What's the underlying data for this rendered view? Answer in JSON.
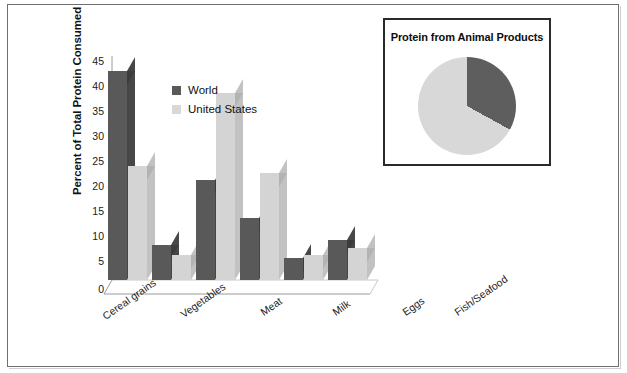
{
  "chart_data": {
    "type": "bar",
    "title": "",
    "xlabel": "",
    "ylabel": "Percent of Total Protein Consumed",
    "ylim": [
      0,
      45
    ],
    "ytick_step": 5,
    "yticks": [
      45,
      40,
      35,
      30,
      25,
      20,
      15,
      10,
      5,
      0
    ],
    "grid": false,
    "legend_position": "inside-upper-left",
    "categories": [
      "Cereal grains",
      "Vegetables",
      "Meat",
      "Milk",
      "Eggs",
      "Fish/Seafood"
    ],
    "series": [
      {
        "name": "World",
        "color": "#595959",
        "values": [
          42,
          7,
          20,
          12.5,
          4.5,
          8
        ]
      },
      {
        "name": "United States",
        "color": "#d4d4d4",
        "values": [
          23,
          5,
          37.5,
          21.5,
          5,
          6.5
        ]
      }
    ],
    "inset": {
      "type": "pie",
      "title": "Protein from Animal Products",
      "slices": [
        {
          "name": "Animal",
          "value": 33,
          "color": "#5e5e5e"
        },
        {
          "name": "Other",
          "value": 67,
          "color": "#d8d8d8"
        }
      ],
      "start_angle_deg": 0
    }
  },
  "axis": {
    "y_title": "Percent of Total Protein Consumed",
    "y_tick_0": "0",
    "y_tick_5": "5",
    "y_tick_10": "10",
    "y_tick_15": "15",
    "y_tick_20": "20",
    "y_tick_25": "25",
    "y_tick_30": "30",
    "y_tick_35": "35",
    "y_tick_40": "40",
    "y_tick_45": "45"
  },
  "legend": {
    "items": [
      {
        "label": "World"
      },
      {
        "label": "United States"
      }
    ]
  },
  "xaxis": {
    "labels": [
      {
        "text": "Cereal grains"
      },
      {
        "text": "Vegetables"
      },
      {
        "text": "Meat"
      },
      {
        "text": "Milk"
      },
      {
        "text": "Eggs"
      },
      {
        "text": "Fish/Seafood"
      }
    ]
  },
  "inset_panel": {
    "title": "Protein from Animal Products"
  },
  "colors": {
    "world_bar_face": "#595959",
    "world_bar_top": "#3c3c3c",
    "world_bar_side": "#474747",
    "us_bar_face": "#d4d4d4",
    "us_bar_top": "#b3b3b3",
    "us_bar_side": "#c2c2c2",
    "axis_line": "#8c8c8c",
    "frame": "#6f6f6f",
    "text": "#1a1a1a"
  }
}
